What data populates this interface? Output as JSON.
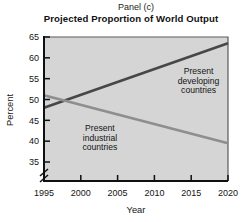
{
  "panel_label": "Panel (c)",
  "title": "Projected Proportion of World Output",
  "chart_data": {
    "type": "line",
    "x": [
      1995,
      2020
    ],
    "series": [
      {
        "name": "Present developing countries",
        "values": [
          48,
          63.5
        ],
        "color": "#474747",
        "annotation": {
          "lines": [
            "Present",
            "developing",
            "countries"
          ],
          "x": 2016,
          "y": 54.5
        }
      },
      {
        "name": "Present industrial countries",
        "values": [
          51,
          39.5
        ],
        "color": "#8e8e8e",
        "annotation": {
          "lines": [
            "Present",
            "industrial",
            "countries"
          ],
          "x": 2002.6,
          "y": 40.8
        }
      }
    ],
    "xlabel": "Year",
    "ylabel": "Percent",
    "x_ticks": [
      "1995",
      "2000",
      "2005",
      "2010",
      "2015",
      "2020"
    ],
    "y_ticks": [
      "65",
      "60",
      "55",
      "50",
      "45",
      "40",
      "35"
    ],
    "xlim": [
      1995,
      2020
    ],
    "ylim": [
      35,
      65
    ],
    "axis_break": true,
    "grid": false,
    "legend": "none",
    "plot_bg_color": "#d5d5d5",
    "axis_color": "#101010",
    "frame_color": "#5a5a5a"
  }
}
